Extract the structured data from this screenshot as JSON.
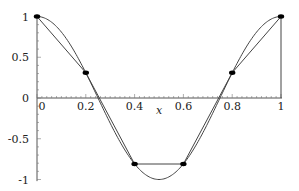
{
  "chart_data": {
    "type": "line",
    "title": "",
    "xlabel": "x",
    "ylabel": "",
    "xlim": [
      0,
      1
    ],
    "ylim": [
      -1,
      1
    ],
    "grid": false,
    "legend": null,
    "x_ticks": [
      "0",
      "0.2",
      "0.4",
      "0.6",
      "0.8",
      "1"
    ],
    "y_ticks": [
      "1",
      "0.5",
      "0",
      "-0.5",
      "-1"
    ],
    "series": [
      {
        "name": "cos(2πx)",
        "style": "smooth curve",
        "x": [
          0,
          0.1,
          0.2,
          0.3,
          0.4,
          0.5,
          0.6,
          0.7,
          0.8,
          0.9,
          1.0
        ],
        "values": [
          1,
          0.81,
          0.31,
          -0.31,
          -0.81,
          -1,
          -0.81,
          -0.31,
          0.31,
          0.81,
          1
        ]
      },
      {
        "name": "piecewise linear interpolant",
        "style": "line with markers",
        "x": [
          0,
          0.2,
          0.4,
          0.6,
          0.8,
          1.0
        ],
        "values": [
          1,
          0.31,
          -0.81,
          -0.81,
          0.31,
          1
        ]
      }
    ],
    "annotations": [
      "vertical line at x=1 from y=0 to y=1"
    ]
  },
  "axes": {
    "x_label": "x",
    "x_tick_labels": [
      "0",
      "0.2",
      "0.4",
      "0.6",
      "0.8",
      "1"
    ],
    "y_tick_labels": [
      "1",
      "0.5",
      "0",
      "-0.5",
      "-1"
    ]
  }
}
